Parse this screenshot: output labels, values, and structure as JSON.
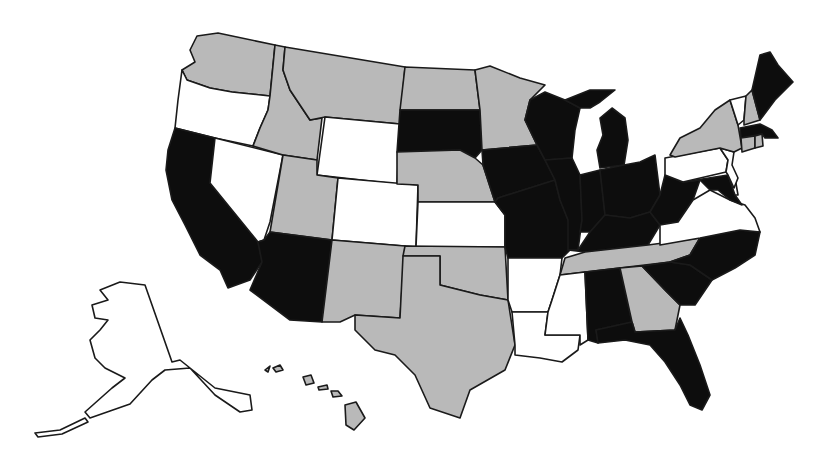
{
  "map": {
    "type": "choropleth",
    "region": "United States",
    "categories": [
      {
        "id": "black",
        "color": "#0d0d0d"
      },
      {
        "id": "gray",
        "color": "#b9b9b9"
      },
      {
        "id": "white",
        "color": "#ffffff"
      }
    ],
    "states": {
      "WA": "gray",
      "OR": "white",
      "CA": "black",
      "NV": "white",
      "ID": "gray",
      "MT": "gray",
      "WY": "white",
      "UT": "gray",
      "AZ": "black",
      "CO": "white",
      "NM": "gray",
      "ND": "gray",
      "SD": "black",
      "NE": "gray",
      "KS": "white",
      "OK": "gray",
      "TX": "gray",
      "MN": "gray",
      "IA": "black",
      "MO": "black",
      "AR": "white",
      "LA": "white",
      "WI": "black",
      "IL": "black",
      "MI": "black",
      "IN": "black",
      "OH": "black",
      "KY": "black",
      "TN": "gray",
      "MS": "white",
      "AL": "black",
      "GA": "gray",
      "FL": "black",
      "SC": "black",
      "NC": "black",
      "VA": "white",
      "WV": "black",
      "MD": "black",
      "DE": "white",
      "NJ": "white",
      "PA": "white",
      "NY": "gray",
      "VT": "white",
      "NH": "gray",
      "ME": "black",
      "MA": "black",
      "CT": "gray",
      "RI": "gray",
      "AK": "white",
      "HI": "gray"
    }
  }
}
